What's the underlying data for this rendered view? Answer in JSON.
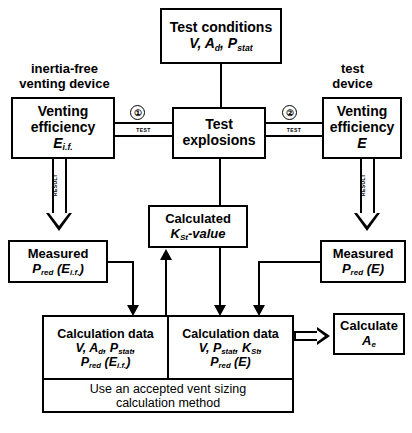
{
  "diagram": {
    "captions": {
      "left": {
        "line1": "inertia-free",
        "line2": "venting device"
      },
      "right": {
        "line1": "test",
        "line2": "device"
      }
    },
    "boxes": {
      "test_conditions": {
        "line1": "Test conditions",
        "line2_html": "V, A<sub>d</sub>, P<sub>stat</sub>"
      },
      "venting_eff_left": {
        "line1": "Venting",
        "line2": "efficiency",
        "line3_html": "E<sub>i.f.</sub>"
      },
      "test_explosions": {
        "line1": "Test",
        "line2": "explosions"
      },
      "venting_eff_right": {
        "line1": "Venting",
        "line2": "efficiency",
        "line3_html": "E"
      },
      "measured_left": {
        "line1": "Measured",
        "line2_html": "P<sub>red</sub> (E<sub>i.f.</sub>)"
      },
      "calculated_kst": {
        "line1": "Calculated",
        "line2_html": "K<sub>St</sub>-value"
      },
      "measured_right": {
        "line1": "Measured",
        "line2_html": "P<sub>red</sub> (E)"
      },
      "calc_data_left": {
        "line1": "Calculation data",
        "line2_html": "V, A<sub>d</sub>, P<sub>stat</sub>,",
        "line3_html": "P<sub>red</sub> (E<sub>i.f.</sub>)"
      },
      "calc_data_right": {
        "line1": "Calculation data",
        "line2_html": "V, P<sub>stat</sub>, K<sub>St</sub>,",
        "line3_html": "P<sub>red</sub> (E)"
      },
      "method": {
        "line1": "Use an accepted vent sizing",
        "line2": "calculation method"
      },
      "calculate_ae": {
        "line1": "Calculate",
        "line2_html": "A<sub>e</sub>"
      }
    },
    "connectors": {
      "test_tag_left": "TEST",
      "test_tag_right": "TEST",
      "result_tag_left": "RESULT",
      "result_tag_right": "RESULT",
      "marker_1": "①",
      "marker_2": "②"
    },
    "colors": {
      "stroke": "#000000",
      "background": "#ffffff"
    }
  }
}
